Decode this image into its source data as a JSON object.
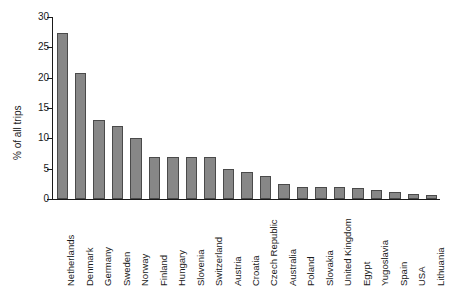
{
  "chart_data": {
    "type": "bar",
    "title": "",
    "subtitle": "",
    "xlabel": "",
    "ylabel": "% of all trips",
    "ylim": [
      0,
      30
    ],
    "yticks": [
      0,
      5,
      10,
      15,
      20,
      25,
      30
    ],
    "grid": false,
    "legend": null,
    "bar_color": "#878787",
    "bar_edge_color": "#4a4a4a",
    "axis_color": "#1a1a1a",
    "categories": [
      "Netherlands",
      "Denmark",
      "Germany",
      "Sweden",
      "Norway",
      "Finland",
      "Hungary",
      "Slovenia",
      "Switzerland",
      "Austria",
      "Croatia",
      "Czech Republic",
      "Australia",
      "Poland",
      "Slovakia",
      "United Kingdom",
      "Egypt",
      "Yugoslavia",
      "Spain",
      "USA",
      "Lithuania"
    ],
    "values": [
      27.3,
      20.8,
      13.0,
      12.0,
      10.0,
      6.9,
      6.9,
      6.9,
      6.9,
      5.0,
      4.4,
      3.8,
      2.5,
      2.0,
      2.0,
      2.0,
      1.8,
      1.5,
      1.1,
      0.9,
      0.6
    ]
  }
}
